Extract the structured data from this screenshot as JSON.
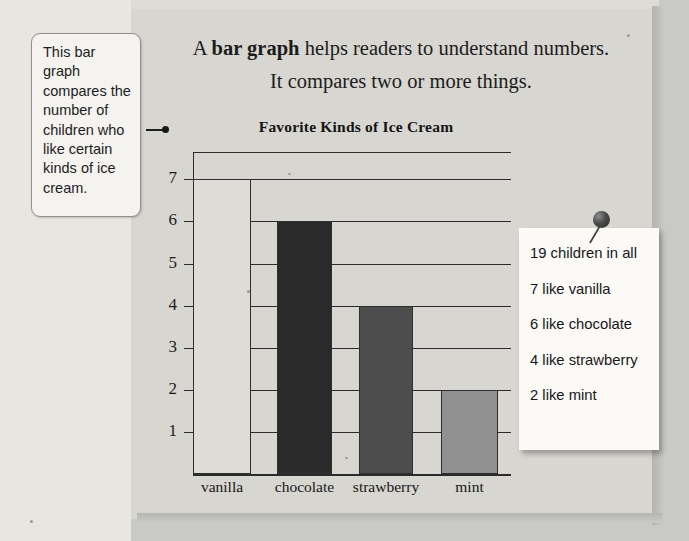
{
  "page": {
    "intro_prefix": "A ",
    "intro_bold": "bar graph",
    "intro_rest": " helps readers to understand numbers. It compares two or more things."
  },
  "callout_left": {
    "text": "This bar graph compares the number of children who like certain kinds of ice cream.",
    "pointer_icon": "arrow-pointer-icon"
  },
  "note_right": {
    "pin_icon": "pushpin-icon",
    "lines": [
      "19 children in all",
      "7 like vanilla",
      "6 like chocolate",
      "4 like strawberry",
      "2 like mint"
    ]
  },
  "chart_data": {
    "type": "bar",
    "title": "Favorite Kinds of Ice Cream",
    "xlabel": "",
    "ylabel": "",
    "categories": [
      "vanilla",
      "chocolate",
      "strawberry",
      "mint"
    ],
    "values": [
      7,
      6,
      4,
      2
    ],
    "bar_colors": [
      "#dedcd6",
      "#2a2a2a",
      "#4d4d4d",
      "#909090"
    ],
    "ylim": [
      0,
      7.65
    ],
    "yticks": [
      1,
      2,
      3,
      4,
      5,
      6,
      7
    ],
    "ytick_labels": [
      "1",
      "2",
      "3",
      "4",
      "5",
      "6",
      "7"
    ],
    "grid": true,
    "legend": "none",
    "axis_color": "#2b2b2b"
  }
}
